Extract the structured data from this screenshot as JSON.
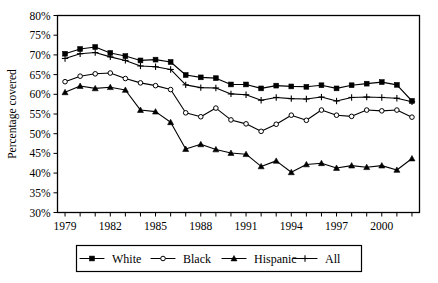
{
  "chart_data": {
    "type": "line",
    "title": "",
    "subtitle": "",
    "xlabel": "",
    "ylabel": "Percentage covered",
    "grid": false,
    "legend_position": "bottom",
    "xlim": [
      1979,
      2002
    ],
    "ylim": [
      30,
      80
    ],
    "y_tick_step": 5,
    "y_ticks": [
      "30%",
      "35%",
      "40%",
      "45%",
      "50%",
      "55%",
      "60%",
      "65%",
      "70%",
      "75%",
      "80%"
    ],
    "y_tick_values": [
      30,
      35,
      40,
      45,
      50,
      55,
      60,
      65,
      70,
      75,
      80
    ],
    "x": [
      1979,
      1980,
      1981,
      1982,
      1983,
      1984,
      1985,
      1986,
      1987,
      1988,
      1989,
      1990,
      1991,
      1992,
      1993,
      1994,
      1995,
      1996,
      1997,
      1998,
      1999,
      2000,
      2001,
      2002
    ],
    "x_tick_labels": [
      "1979",
      "",
      "",
      "1982",
      "",
      "",
      "1985",
      "",
      "",
      "1988",
      "",
      "",
      "1991",
      "",
      "",
      "1994",
      "",
      "",
      "1997",
      "",
      "",
      "2000",
      "",
      ""
    ],
    "x_labeled_ticks": [
      "1979",
      "1982",
      "1985",
      "1988",
      "1991",
      "1994",
      "1997",
      "2000"
    ],
    "series": [
      {
        "name": "White",
        "marker": "filled-square",
        "color": "#000000",
        "values": [
          70.3,
          71.5,
          72.0,
          70.5,
          69.7,
          68.6,
          68.8,
          68.2,
          64.9,
          64.3,
          64.1,
          62.5,
          62.5,
          61.5,
          62.2,
          62.0,
          61.9,
          62.3,
          61.5,
          62.3,
          62.7,
          63.1,
          62.4,
          58.3
        ]
      },
      {
        "name": "Black",
        "marker": "open-circle",
        "color": "#000000",
        "values": [
          63.2,
          64.6,
          65.2,
          65.4,
          64.0,
          62.9,
          62.2,
          61.2,
          55.3,
          54.3,
          56.5,
          53.5,
          52.5,
          50.6,
          52.4,
          54.7,
          53.4,
          56.0,
          54.7,
          54.4,
          56.0,
          55.8,
          56.0,
          54.2
        ]
      },
      {
        "name": "Hispanic",
        "marker": "filled-triangle",
        "color": "#000000",
        "values": [
          60.5,
          62.1,
          61.5,
          61.8,
          61.1,
          56.0,
          55.6,
          52.9,
          46.1,
          47.3,
          46.0,
          45.1,
          44.8,
          41.7,
          43.1,
          40.2,
          42.2,
          42.5,
          41.3,
          41.9,
          41.5,
          41.9,
          40.8,
          43.7
        ]
      },
      {
        "name": "All",
        "marker": "plus",
        "color": "#000000",
        "values": [
          69.1,
          70.3,
          70.6,
          69.5,
          68.6,
          67.2,
          67.0,
          66.3,
          62.4,
          61.7,
          61.6,
          60.1,
          59.9,
          58.5,
          59.2,
          58.9,
          58.8,
          59.3,
          58.3,
          59.2,
          59.3,
          59.2,
          59.0,
          58.1
        ]
      }
    ]
  },
  "axis": {
    "y_label": "Percentage covered"
  },
  "legend": {
    "items": [
      {
        "label": "White",
        "marker": "filled-square"
      },
      {
        "label": "Black",
        "marker": "open-circle"
      },
      {
        "label": "Hispanic",
        "marker": "filled-triangle"
      },
      {
        "label": "All",
        "marker": "plus"
      }
    ]
  }
}
